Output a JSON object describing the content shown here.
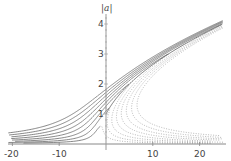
{
  "chart_data": {
    "type": "line",
    "title": "",
    "xlabel": "",
    "ylabel": "|a|",
    "xlim": [
      -21,
      25
    ],
    "ylim": [
      0,
      4.3
    ],
    "grid": false,
    "legend": null,
    "x_ticks": [
      -20,
      -10,
      10,
      20
    ],
    "x_tick_labels": [
      "-20",
      "-10",
      "10",
      "20"
    ],
    "y_ticks": [
      1,
      2,
      3,
      4
    ],
    "y_tick_labels": [
      "1",
      "2",
      "3",
      "4"
    ],
    "backbone": {
      "description": "solid upper branch",
      "a2_intercept": 1.0,
      "a2_slope": 0.6,
      "x_end": 24,
      "y_end": 4.0
    },
    "series": [
      {
        "name": "f1",
        "forcing": 0.3,
        "style": "solid"
      },
      {
        "name": "f2",
        "forcing": 0.6,
        "style": "solid"
      },
      {
        "name": "f3",
        "forcing": 1.0,
        "style": "solid"
      },
      {
        "name": "f4",
        "forcing": 1.5,
        "style": "solid"
      },
      {
        "name": "f5",
        "forcing": 2.1,
        "style": "solid"
      },
      {
        "name": "f6",
        "forcing": 2.8,
        "style": "solid"
      },
      {
        "name": "f7",
        "forcing": 3.6,
        "style": "solid"
      },
      {
        "name": "f8",
        "forcing": 4.5,
        "style": "solid"
      }
    ],
    "sample_points": [
      {
        "x": 0,
        "y": 1.0
      },
      {
        "x": 5,
        "y": 2.0
      },
      {
        "x": 11,
        "y": 2.7
      },
      {
        "x": 16,
        "y": 3.3
      },
      {
        "x": 24,
        "y": 4.0
      },
      {
        "x": -20,
        "y": 0.05
      },
      {
        "x": 24,
        "y": 0.05
      }
    ]
  },
  "axes": {
    "y_title": "|a|",
    "x_labels": [
      "-20",
      "-10",
      "10",
      "20"
    ],
    "y_labels": [
      "1",
      "2",
      "3",
      "4"
    ]
  },
  "colors": {
    "curve": "#555555",
    "unstable": "#999999",
    "axis": "#888888",
    "text": "#444444"
  }
}
